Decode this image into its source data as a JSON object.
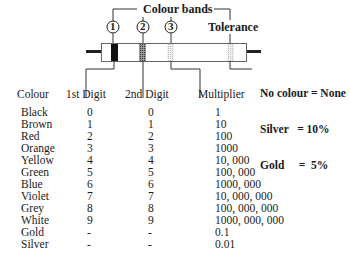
{
  "diagram": {
    "title": "Colour bands",
    "band_markers": [
      "1",
      "2",
      "3"
    ],
    "tolerance_label": "Tolerance",
    "tolerance_notes": [
      "No colour = None",
      "Silver   = 10%",
      "Gold     =  5%"
    ],
    "colors": {
      "band1": "#111111",
      "band2": "#555555",
      "band3": "#cccccc",
      "tolerance_band": "#cccccc",
      "body_outline": "#555555",
      "lead": "#222222"
    }
  },
  "table": {
    "headers": [
      "Colour",
      "1st Digit",
      "2nd Digit",
      "Multiplier"
    ],
    "rows": [
      {
        "colour": "Black",
        "d1": "0",
        "d2": "0",
        "mult": "1"
      },
      {
        "colour": "Brown",
        "d1": "1",
        "d2": "1",
        "mult": "10"
      },
      {
        "colour": "Red",
        "d1": "2",
        "d2": "2",
        "mult": "100"
      },
      {
        "colour": "Orange",
        "d1": "3",
        "d2": "3",
        "mult": "1000"
      },
      {
        "colour": "Yellow",
        "d1": "4",
        "d2": "4",
        "mult": "10, 000"
      },
      {
        "colour": "Green",
        "d1": "5",
        "d2": "5",
        "mult": "100, 000"
      },
      {
        "colour": "Blue",
        "d1": "6",
        "d2": "6",
        "mult": "1000, 000"
      },
      {
        "colour": "Violet",
        "d1": "7",
        "d2": "7",
        "mult": "10, 000, 000"
      },
      {
        "colour": "Grey",
        "d1": "8",
        "d2": "8",
        "mult": "100, 000, 000"
      },
      {
        "colour": "White",
        "d1": "9",
        "d2": "9",
        "mult": "1000, 000, 000"
      },
      {
        "colour": "Gold",
        "d1": "-",
        "d2": "-",
        "mult": "0.1"
      },
      {
        "colour": "Silver",
        "d1": "-",
        "d2": "-",
        "mult": "0.01"
      }
    ]
  }
}
